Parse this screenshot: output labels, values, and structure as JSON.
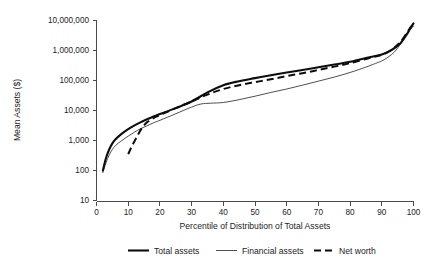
{
  "chart_data": {
    "type": "line",
    "title": "",
    "xlabel": "Percentile of Distribution of Total Assets",
    "ylabel": "Mean Assets ($)",
    "xlim": [
      0,
      100
    ],
    "ylim": [
      10,
      10000000
    ],
    "yscale": "log",
    "grid": false,
    "legend_position": "bottom",
    "xticks": [
      "0",
      "10",
      "20",
      "30",
      "40",
      "50",
      "60",
      "70",
      "80",
      "90",
      "100"
    ],
    "yticks": [
      "10",
      "100",
      "1,000",
      "10,000",
      "100,000",
      "1,000,000",
      "10,000,000"
    ],
    "series": [
      {
        "name": "Total assets",
        "style": "thick-solid",
        "color": "#0d0d0d",
        "x": [
          2,
          3,
          4,
          5,
          6,
          8,
          10,
          12,
          14,
          16,
          18,
          20,
          25,
          30,
          35,
          40,
          45,
          50,
          55,
          60,
          65,
          70,
          75,
          80,
          85,
          88,
          90,
          92,
          94,
          96,
          98,
          99,
          100
        ],
        "y": [
          100,
          260,
          500,
          800,
          1100,
          1700,
          2400,
          3200,
          4100,
          5100,
          6300,
          7600,
          12000,
          20000,
          40000,
          70000,
          95000,
          120000,
          150000,
          185000,
          225000,
          275000,
          340000,
          420000,
          560000,
          660000,
          740000,
          900000,
          1200000,
          1800000,
          3600000,
          5500000,
          8000000
        ]
      },
      {
        "name": "Financial assets",
        "style": "thin-solid",
        "color": "#3a3a3a",
        "x": [
          2,
          3,
          4,
          5,
          6,
          8,
          10,
          12,
          14,
          16,
          18,
          20,
          25,
          30,
          33,
          36,
          40,
          45,
          50,
          55,
          60,
          65,
          70,
          75,
          80,
          85,
          88,
          90,
          92,
          94,
          96,
          98,
          99,
          100
        ],
        "y": [
          85,
          180,
          330,
          500,
          680,
          1000,
          1400,
          1900,
          2500,
          3100,
          3900,
          4700,
          7800,
          13000,
          16500,
          17500,
          18500,
          23000,
          30000,
          40000,
          52000,
          70000,
          95000,
          130000,
          185000,
          280000,
          370000,
          450000,
          600000,
          900000,
          1700000,
          3600000,
          5000000,
          6500000
        ]
      },
      {
        "name": "Net worth",
        "style": "dashed",
        "color": "#0d0d0d",
        "x": [
          10,
          11,
          12,
          13,
          14,
          15,
          16,
          18,
          20,
          25,
          30,
          35,
          40,
          45,
          50,
          55,
          60,
          65,
          70,
          75,
          80,
          85,
          88,
          90,
          92,
          94,
          96,
          98,
          99,
          100
        ],
        "y": [
          350,
          600,
          950,
          1500,
          2300,
          3200,
          4100,
          5600,
          7000,
          12000,
          20000,
          34000,
          52000,
          70000,
          88000,
          110000,
          140000,
          175000,
          225000,
          290000,
          380000,
          520000,
          630000,
          720000,
          900000,
          1250000,
          2000000,
          4000000,
          5800000,
          7600000
        ]
      }
    ],
    "legend": [
      {
        "label": "Total assets",
        "style": "thick-solid"
      },
      {
        "label": "Financial assets",
        "style": "thin-solid"
      },
      {
        "label": "Net worth",
        "style": "dashed"
      }
    ]
  }
}
